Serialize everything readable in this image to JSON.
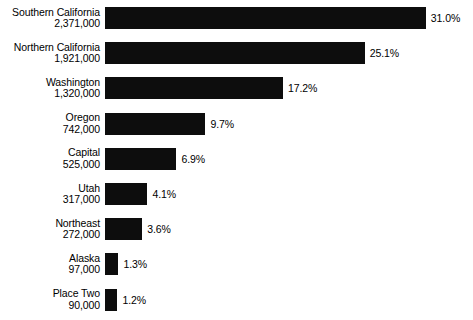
{
  "chart_data": {
    "type": "bar",
    "orientation": "horizontal",
    "title": "",
    "subtitle": "",
    "xlabel": "",
    "ylabel": "",
    "grid": false,
    "legend": null,
    "axis_visible": false,
    "xlim": [
      0,
      31.0
    ],
    "value_unit": "%",
    "bar_color": "#0d0d0d",
    "background_color": "#ffffff",
    "categories": [
      "Southern California",
      "Northern California",
      "Washington",
      "Oregon",
      "Capital",
      "Utah",
      "Northeast",
      "Alaska",
      "Place Two"
    ],
    "counts": [
      "2,371,000",
      "1,921,000",
      "1,320,000",
      "742,000",
      "525,000",
      "317,000",
      "272,000",
      "97,000",
      "90,000"
    ],
    "values": [
      31.0,
      25.1,
      17.2,
      9.7,
      6.9,
      4.1,
      3.6,
      1.3,
      1.2
    ],
    "value_labels": [
      "31.0%",
      "25.1%",
      "17.2%",
      "9.7%",
      "6.9%",
      "4.1%",
      "3.6%",
      "1.3%",
      "1.2%"
    ],
    "rows": [
      {
        "category": "Southern California",
        "count": "2,371,000",
        "value": 31.0,
        "value_label": "31.0%"
      },
      {
        "category": "Northern California",
        "count": "1,921,000",
        "value": 25.1,
        "value_label": "25.1%"
      },
      {
        "category": "Washington",
        "count": "1,320,000",
        "value": 17.2,
        "value_label": "17.2%"
      },
      {
        "category": "Oregon",
        "count": "742,000",
        "value": 9.7,
        "value_label": "9.7%"
      },
      {
        "category": "Capital",
        "count": "525,000",
        "value": 6.9,
        "value_label": "6.9%"
      },
      {
        "category": "Utah",
        "count": "317,000",
        "value": 4.1,
        "value_label": "4.1%"
      },
      {
        "category": "Northeast",
        "count": "272,000",
        "value": 3.6,
        "value_label": "3.6%"
      },
      {
        "category": "Alaska",
        "count": "97,000",
        "value": 1.3,
        "value_label": "1.3%"
      },
      {
        "category": "Place Two",
        "count": "90,000",
        "value": 1.2,
        "value_label": "1.2%"
      }
    ]
  },
  "layout": {
    "px_per_percent": 10.35,
    "row_top_start": 3,
    "row_pitch": 35.2
  }
}
